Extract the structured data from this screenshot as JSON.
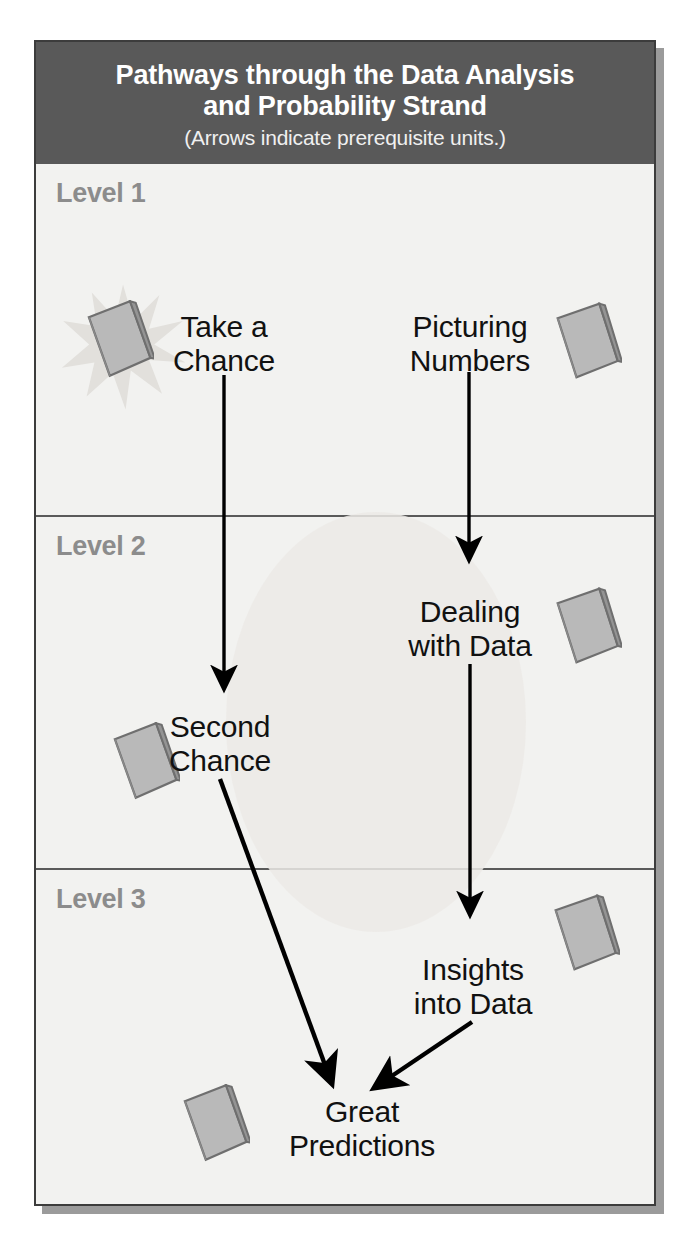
{
  "header": {
    "title": "Pathways through the Data Analysis\nand Probability Strand",
    "subtitle": "(Arrows indicate prerequisite units.)"
  },
  "levels": [
    {
      "label": "Level 1"
    },
    {
      "label": "Level 2"
    },
    {
      "label": "Level 3"
    }
  ],
  "units": [
    {
      "id": "take-a-chance",
      "label": "Take a\nChance",
      "level": 1
    },
    {
      "id": "picturing-numbers",
      "label": "Picturing\nNumbers",
      "level": 1
    },
    {
      "id": "dealing-with-data",
      "label": "Dealing\nwith Data",
      "level": 2
    },
    {
      "id": "second-chance",
      "label": "Second\nChance",
      "level": 2
    },
    {
      "id": "insights-into-data",
      "label": "Insights\ninto Data",
      "level": 3
    },
    {
      "id": "great-predictions",
      "label": "Great\nPredictions",
      "level": 3
    }
  ],
  "arrows": [
    {
      "from": "take-a-chance",
      "to": "second-chance"
    },
    {
      "from": "picturing-numbers",
      "to": "dealing-with-data"
    },
    {
      "from": "dealing-with-data",
      "to": "insights-into-data"
    },
    {
      "from": "second-chance",
      "to": "great-predictions"
    },
    {
      "from": "insights-into-data",
      "to": "great-predictions"
    }
  ],
  "icons": {
    "book": "book-icon",
    "burst": "starburst-icon"
  },
  "colors": {
    "header_band": "#595959",
    "panel_background": "#f2f2f0",
    "panel_border": "#3c3c3c",
    "level_label": "#8c8c8c",
    "unit_label": "#111111",
    "arrow": "#000000",
    "book_fill": "#b4b4b4",
    "book_outline": "#6e6e6e",
    "shadow": "#9b9b9b"
  }
}
